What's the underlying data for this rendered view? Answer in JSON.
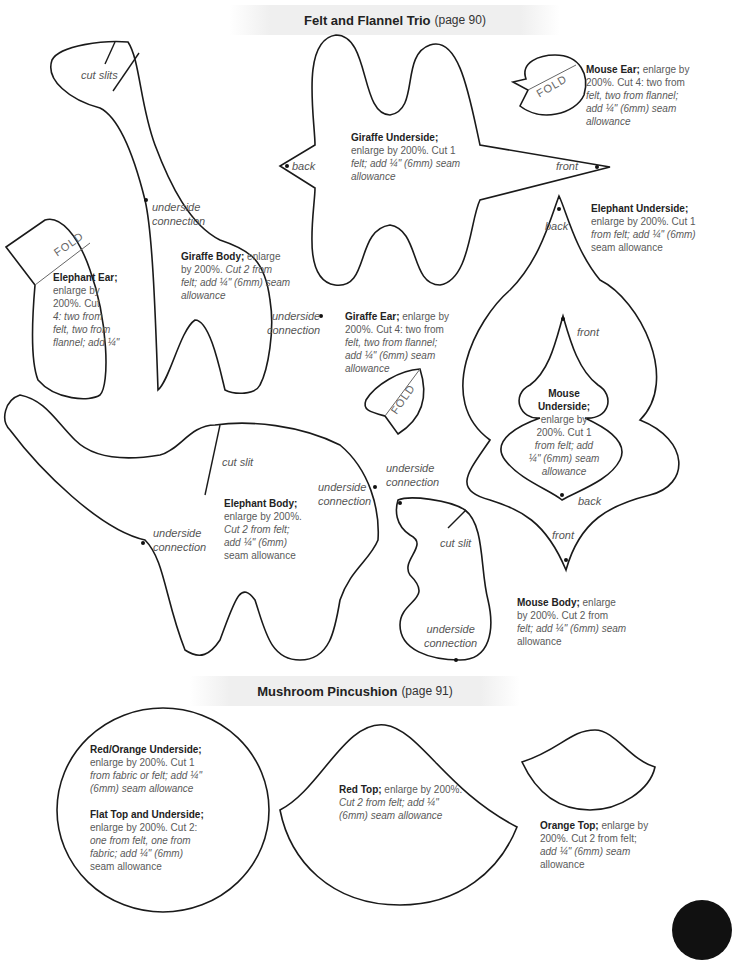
{
  "sections": {
    "felt_flannel": {
      "title": "Felt and Flannel Trio",
      "page": "(page 90)"
    },
    "mushroom": {
      "title": "Mushroom Pincushion",
      "page": "(page 91)"
    }
  },
  "pieces": {
    "giraffe_body": {
      "name": "Giraffe Body;",
      "l1": " enlarge",
      "l2": "by 200%. ",
      "l2i": "Cut 2 from",
      "l3": "felt; add ¼\" (6mm) seam",
      "l4": "allowance"
    },
    "giraffe_underside": {
      "name": "Giraffe Underside;",
      "l1": "enlarge by 200%. Cut 1",
      "l2": "felt; add ¼\" (6mm) seam",
      "l3": "allowance"
    },
    "mouse_ear": {
      "name": "Mouse Ear;",
      "l1": " enlarge by",
      "l2": "200%. Cut 4: two from",
      "l3": "felt, two from flannel;",
      "l4": "add ¼\" (6mm) seam",
      "l5": "allowance"
    },
    "elephant_underside": {
      "name": "Elephant Underside;",
      "l1": "enlarge by 200%. Cut 1",
      "l2": "from felt; add ¼\" (6mm)",
      "l3": "seam allowance"
    },
    "elephant_ear": {
      "name": "Elephant Ear;",
      "l1": "enlarge by",
      "l2": "200%. Cut",
      "l3": "4: two from",
      "l4": "felt, two from",
      "l5": "flannel; add ¼\""
    },
    "giraffe_ear": {
      "name": "Giraffe Ear;",
      "l1": " enlarge by",
      "l2": "200%. Cut 4: two from",
      "l3": "felt, two from flannel;",
      "l4": "add ¼\" (6mm) seam",
      "l5": "allowance"
    },
    "mouse_underside": {
      "name1": "Mouse",
      "name2": "Underside;",
      "l1": "enlarge by",
      "l2": "200%. Cut 1",
      "l3": "from felt; add",
      "l4": "¼\" (6mm) seam",
      "l5": "allowance"
    },
    "elephant_body": {
      "name": "Elephant Body;",
      "l1": "enlarge by 200%.",
      "l2": "Cut 2 from felt;",
      "l3": "add ¼\" (6mm)",
      "l4": "seam allowance"
    },
    "mouse_body": {
      "name": "Mouse Body;",
      "l1": " enlarge",
      "l2": "by 200%. Cut 2 from",
      "l3": "felt; add ¼\" (6mm) seam",
      "l4": "allowance"
    },
    "red_orange_underside": {
      "name": "Red/Orange Underside;",
      "l1": "enlarge by 200%. Cut 1",
      "l2": "from fabric or felt; add ¼\"",
      "l3": "(6mm) seam allowance"
    },
    "flat_top": {
      "name": "Flat Top and Underside;",
      "l1": "enlarge by 200%. Cut 2:",
      "l2": "one from felt, one from",
      "l3": "fabric; add ¼\" (6mm)",
      "l4": "seam allowance"
    },
    "red_top": {
      "name": "Red Top;",
      "l1": " enlarge by 200%.",
      "l2": "Cut 2 from felt; add ¼\"",
      "l3": "(6mm) seam allowance"
    },
    "orange_top": {
      "name": "Orange Top;",
      "l1": " enlarge by",
      "l2": "200%. Cut 2 from felt;",
      "l3": "add ¼\" (6mm) seam",
      "l4": "allowance"
    }
  },
  "marks": {
    "cut_slits": "cut slits",
    "cut_slit": "cut slit",
    "underside": "underside",
    "connection": "connection",
    "back": "back",
    "front": "front",
    "fold": "FOLD"
  }
}
